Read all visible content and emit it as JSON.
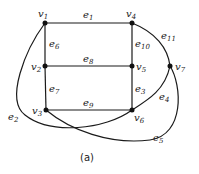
{
  "caption": "(a)",
  "vertices": [
    {
      "id": "v1",
      "base": "v",
      "sub": "1",
      "x": 45,
      "y": 23
    },
    {
      "id": "v2",
      "base": "v",
      "sub": "2",
      "x": 45,
      "y": 66
    },
    {
      "id": "v3",
      "base": "v",
      "sub": "3",
      "x": 46,
      "y": 110
    },
    {
      "id": "v4",
      "base": "v",
      "sub": "4",
      "x": 132,
      "y": 23
    },
    {
      "id": "v5",
      "base": "v",
      "sub": "5",
      "x": 132,
      "y": 66
    },
    {
      "id": "v6",
      "base": "v",
      "sub": "6",
      "x": 132,
      "y": 110
    },
    {
      "id": "v7",
      "base": "v",
      "sub": "7",
      "x": 170,
      "y": 66
    }
  ],
  "edges": [
    {
      "id": "e1",
      "base": "e",
      "sub": "1",
      "from": "v1",
      "to": "v4"
    },
    {
      "id": "e2",
      "base": "e",
      "sub": "2",
      "from": "v1",
      "to": "v6"
    },
    {
      "id": "e3",
      "base": "e",
      "sub": "3",
      "from": "v5",
      "to": "v6"
    },
    {
      "id": "e4",
      "base": "e",
      "sub": "4",
      "from": "v6",
      "to": "v7"
    },
    {
      "id": "e5",
      "base": "e",
      "sub": "5",
      "from": "v3",
      "to": "v7"
    },
    {
      "id": "e6",
      "base": "e",
      "sub": "6",
      "from": "v1",
      "to": "v2"
    },
    {
      "id": "e7",
      "base": "e",
      "sub": "7",
      "from": "v2",
      "to": "v3"
    },
    {
      "id": "e8",
      "base": "e",
      "sub": "8",
      "from": "v2",
      "to": "v5"
    },
    {
      "id": "e9",
      "base": "e",
      "sub": "9",
      "from": "v3",
      "to": "v6"
    },
    {
      "id": "e10",
      "base": "e",
      "sub": "10",
      "from": "v4",
      "to": "v5"
    },
    {
      "id": "e11",
      "base": "e",
      "sub": "11",
      "from": "v4",
      "to": "v7"
    }
  ],
  "labels": {
    "v1": {
      "base": "v",
      "sub": "1"
    },
    "v2": {
      "base": "v",
      "sub": "2"
    },
    "v3": {
      "base": "v",
      "sub": "3"
    },
    "v4": {
      "base": "v",
      "sub": "4"
    },
    "v5": {
      "base": "v",
      "sub": "5"
    },
    "v6": {
      "base": "v",
      "sub": "6"
    },
    "v7": {
      "base": "v",
      "sub": "7"
    },
    "e1": {
      "base": "e",
      "sub": "1"
    },
    "e2": {
      "base": "e",
      "sub": "2"
    },
    "e3": {
      "base": "e",
      "sub": "3"
    },
    "e4": {
      "base": "e",
      "sub": "4"
    },
    "e5": {
      "base": "e",
      "sub": "5"
    },
    "e6": {
      "base": "e",
      "sub": "6"
    },
    "e7": {
      "base": "e",
      "sub": "7"
    },
    "e8": {
      "base": "e",
      "sub": "8"
    },
    "e9": {
      "base": "e",
      "sub": "9"
    },
    "e10": {
      "base": "e",
      "sub": "10"
    },
    "e11": {
      "base": "e",
      "sub": "11"
    }
  }
}
